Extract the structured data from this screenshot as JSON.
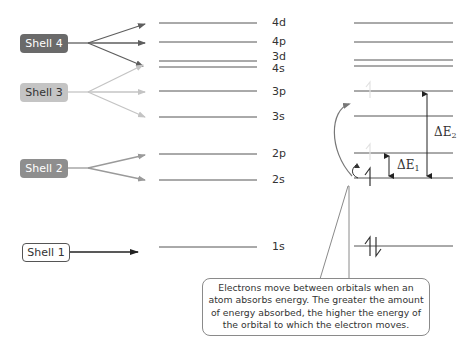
{
  "shells": [
    {
      "label": "Shell 4",
      "fill": "#6a6a6a",
      "text_color": "#ffffff",
      "arrow_color": "#6a6a6a",
      "targets": [
        "4d",
        "4p",
        "3d/4s"
      ]
    },
    {
      "label": "Shell 3",
      "fill": "#c4c4c4",
      "text_color": "#333333",
      "arrow_color": "#c4c4c4",
      "targets": [
        "3p",
        "3s",
        "3d/4s"
      ]
    },
    {
      "label": "Shell 2",
      "fill": "#8e8e8e",
      "text_color": "#ffffff",
      "arrow_color": "#9a9a9a",
      "targets": [
        "2p",
        "2s"
      ]
    },
    {
      "label": "Shell 1",
      "fill": "#ffffff",
      "text_color": "#333333",
      "arrow_color": "#222222",
      "targets": [
        "1s"
      ]
    }
  ],
  "orbitals": [
    "4d",
    "4p",
    "3d",
    "4s",
    "3p",
    "3s",
    "2p",
    "2s",
    "1s"
  ],
  "energy_diagram": {
    "delta_e1": {
      "symbol": "ΔE",
      "subscript": "1",
      "from": "2s",
      "to": "2p"
    },
    "delta_e2": {
      "symbol": "ΔE",
      "subscript": "2",
      "from": "2s",
      "to": "3p"
    },
    "electrons": {
      "1s": "↑↓ (paired)",
      "2s": "↑ (single)"
    }
  },
  "callout": {
    "text": "Electrons move between orbitals when an atom absorbs energy. The greater the amount of energy absorbed, the higher the energy of the orbital to which the electron moves."
  }
}
